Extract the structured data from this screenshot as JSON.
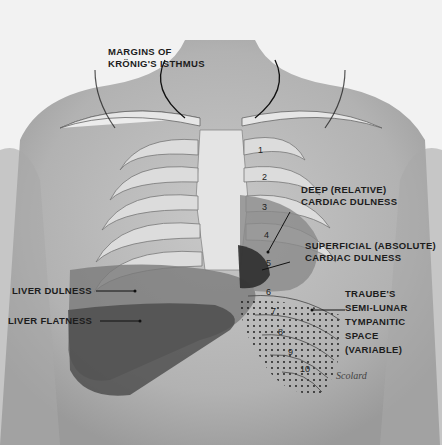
{
  "figure": {
    "labels": {
      "kronig_line1": "MARGINS OF",
      "kronig_line2": "KRÖNIG'S ISTHMUS",
      "deep_line1": "DEEP (RELATIVE)",
      "deep_line2": "CARDIAC DULNESS",
      "superficial_line1": "SUPERFICIAL (ABSOLUTE)",
      "superficial_line2": "CARDIAC DULNESS",
      "liver_dulness": "LIVER DULNESS",
      "liver_flatness": "LIVER FLATNESS",
      "traube_line1": "TRAUBE'S",
      "traube_line2": "SEMI-LUNAR",
      "traube_line3": "TYMPANITIC",
      "traube_line4": "SPACE",
      "traube_line5": "(VARIABLE)"
    },
    "rib_numbers": [
      "1",
      "2",
      "3",
      "4",
      "5",
      "6",
      "7",
      "8",
      "9",
      "10"
    ],
    "signature": "Scolard",
    "colors": {
      "background": "#f2f2f2",
      "skin": "#bdbdbd",
      "rib": "#d9d9d9",
      "deep_dulness": "#8a8a8a",
      "superficial_dulness": "#3a3a3a",
      "liver_dulness": "#6e6e6e",
      "liver_flatness": "#4a4a4a"
    }
  }
}
